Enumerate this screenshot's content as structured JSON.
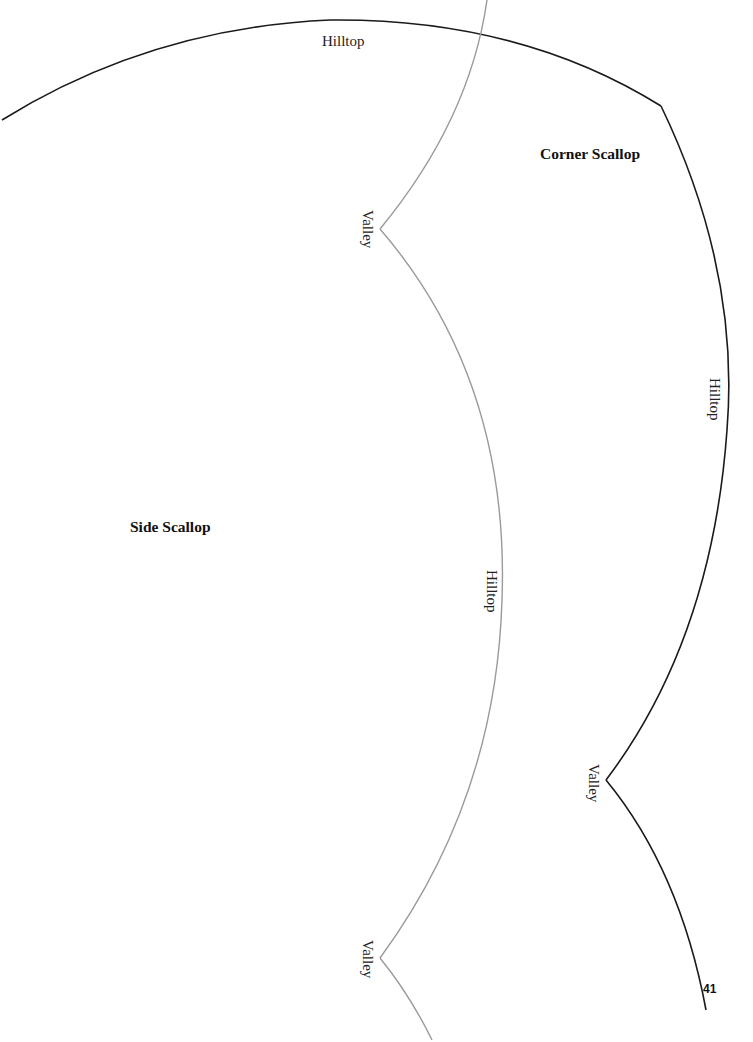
{
  "document": {
    "type": "scallop-template",
    "page_number": "41"
  },
  "labels": {
    "top_hilltop": "Hilltop",
    "corner_scallop_title": "Corner Scallop",
    "side_scallop_title": "Side Scallop",
    "gray_valley_upper": "Valley",
    "gray_hilltop": "Hilltop",
    "gray_valley_lower": "Valley",
    "black_hilltop_right": "Hilltop",
    "black_valley": "Valley"
  },
  "lines": {
    "corner_scallop_color": "#1a1a1a",
    "side_scallop_color": "#9a9a9a"
  }
}
